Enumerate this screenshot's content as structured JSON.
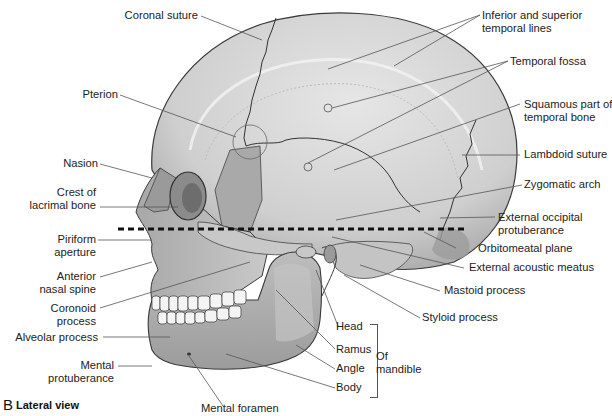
{
  "figure": {
    "panel_letter": "B",
    "caption": "Lateral view",
    "colors": {
      "bone_light": "#d8d8d8",
      "bone_mid": "#b4b4b4",
      "bone_dark": "#8a8a8a",
      "outline": "#3a3a3a",
      "leader_line": "#555555",
      "plane_dashes": "#111111"
    }
  },
  "labels": {
    "left": [
      {
        "id": "coronal-suture",
        "text": "Coronal suture"
      },
      {
        "id": "pterion",
        "text": "Pterion"
      },
      {
        "id": "nasion",
        "text": "Nasion"
      },
      {
        "id": "crest-of-lacrimal-bone",
        "line1": "Crest of",
        "line2": "lacrimal bone"
      },
      {
        "id": "piriform-aperture",
        "line1": "Piriform",
        "line2": "aperture"
      },
      {
        "id": "anterior-nasal-spine",
        "line1": "Anterior",
        "line2": "nasal spine"
      },
      {
        "id": "coronoid-process",
        "line1": "Coronoid",
        "line2": "process"
      },
      {
        "id": "alveolar-process",
        "text": "Alveolar process"
      },
      {
        "id": "mental-protuberance",
        "line1": "Mental",
        "line2": "protuberance"
      },
      {
        "id": "mental-foramen",
        "text": "Mental foramen"
      }
    ],
    "right": [
      {
        "id": "temporal-lines",
        "line1": "Inferior and superior",
        "line2": "temporal lines"
      },
      {
        "id": "temporal-fossa",
        "text": "Temporal fossa"
      },
      {
        "id": "squamous-part",
        "line1": "Squamous part of",
        "line2": "temporal bone"
      },
      {
        "id": "lambdoid-suture",
        "text": "Lambdoid suture"
      },
      {
        "id": "zygomatic-arch",
        "text": "Zygomatic arch"
      },
      {
        "id": "external-occipital-protuberance",
        "line1": "External occipital",
        "line2": "protuberance"
      },
      {
        "id": "orbitomeatal-plane",
        "text": "Orbitomeatal plane"
      },
      {
        "id": "external-acoustic-meatus",
        "text": "External acoustic meatus"
      },
      {
        "id": "mastoid-process",
        "text": "Mastoid process"
      },
      {
        "id": "styloid-process",
        "text": "Styloid process"
      }
    ],
    "mandible": {
      "parts": [
        "Head",
        "Ramus",
        "Angle",
        "Body"
      ],
      "group_line1": "Of",
      "group_line2": "mandible"
    }
  }
}
